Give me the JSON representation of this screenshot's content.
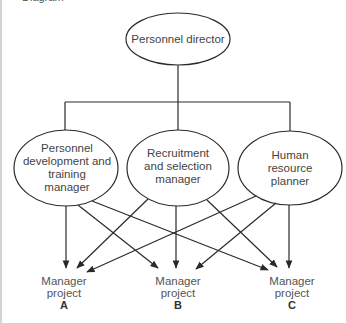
{
  "figure": {
    "cut_off_title": "Diagram"
  },
  "nodes": {
    "director": {
      "label": "Personnel director",
      "cx": 178,
      "cy": 39,
      "rx": 52,
      "ry": 26
    },
    "managers": [
      {
        "label": "Personnel\ndevelopment and\ntraining\nmanager",
        "cx": 66,
        "cy": 168,
        "rx": 52,
        "ry": 38
      },
      {
        "label": "Recruitment\nand selection\nmanager",
        "cx": 178,
        "cy": 168,
        "rx": 51,
        "ry": 38
      },
      {
        "label": "Human resource\nplanner",
        "cx": 290,
        "cy": 168,
        "rx": 52,
        "ry": 37
      }
    ]
  },
  "projects": [
    {
      "line1": "Manager",
      "line2": "project",
      "letter": "A",
      "x": 64,
      "y": 275
    },
    {
      "line1": "Manager",
      "line2": "project",
      "letter": "B",
      "x": 178,
      "y": 275
    },
    {
      "line1": "Manager",
      "line2": "project",
      "letter": "C",
      "x": 292,
      "y": 275
    }
  ],
  "colors": {
    "line": "#2a2a2a",
    "text": "#444444"
  }
}
